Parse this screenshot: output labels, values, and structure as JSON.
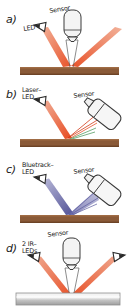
{
  "figure": {
    "type": "technical-diagram",
    "background_color": "#ffffff",
    "colors": {
      "wood_surface": "#8a5a38",
      "wood_surface_dark": "#6d4326",
      "metal_surface_light": "#f2f2f2",
      "metal_surface_mid": "#b9b9b9",
      "red_beam": "#e8532a",
      "red_beam_dark": "#d23a18",
      "blue_beam": "#6f6fae",
      "blue_beam_light": "#a7a7cf",
      "green_ray": "#3f8f4f",
      "outline": "#3a3a3a",
      "body_fill": "#f4f4f4",
      "text": "#1a1a1a"
    }
  },
  "panels": [
    {
      "id": "a",
      "letter": "a)",
      "labels": {
        "source": "LED",
        "sensor": "Sensor"
      },
      "source_count": 1,
      "source_icon": "led-wedge-icon",
      "sensor_icon": "vertical-cylinder-sensor-icon",
      "beam_color": "#e8532a",
      "surface": "wood",
      "surface_color": "#8a5a38"
    },
    {
      "id": "b",
      "letter": "b)",
      "labels": {
        "source": "Laser–\nLED",
        "sensor": "Sensor"
      },
      "source_count": 1,
      "source_icon": "led-wedge-icon",
      "sensor_icon": "tilted-block-sensor-icon",
      "beam_color": "#e8532a",
      "surface": "wood",
      "surface_color": "#8a5a38"
    },
    {
      "id": "c",
      "letter": "c)",
      "labels": {
        "source": "Bluetrack–\nLED",
        "sensor": "Sensor"
      },
      "source_count": 1,
      "source_icon": "led-wedge-icon",
      "sensor_icon": "tilted-block-sensor-icon",
      "beam_color": "#6f6fae",
      "surface": "wood",
      "surface_color": "#8a5a38"
    },
    {
      "id": "d",
      "letter": "d)",
      "labels": {
        "source": "2 IR–\nLEDs",
        "sensor": "Sensor"
      },
      "source_count": 2,
      "source_icon": "led-wedge-icon",
      "sensor_icon": "vertical-cylinder-sensor-icon",
      "beam_color": "#e8532a",
      "surface": "metal",
      "surface_color": "#c9c9c9"
    }
  ]
}
